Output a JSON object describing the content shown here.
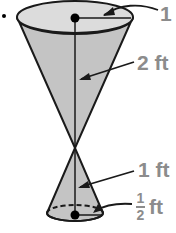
{
  "figure": {
    "type": "double-cone (hourglass) diagram",
    "colors": {
      "cone_fill": "#c8c8c8",
      "cone_top_fill": "#dcdcdc",
      "stroke": "#1a1a1a",
      "label_color": "#8c8c8c"
    },
    "top_cone": {
      "radius_label": "1",
      "height_label": "2 ft"
    },
    "bottom_cone": {
      "height_label": "1 ft",
      "radius_label_numerator": "1",
      "radius_label_denominator": "2",
      "radius_label_unit": "ft"
    }
  }
}
